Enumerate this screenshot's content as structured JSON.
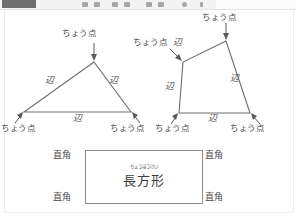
{
  "toolbar": {
    "present": true,
    "icon_names": [
      "menu-button",
      "tool-icon-1",
      "tool-icon-2",
      "tool-icon-3",
      "tool-icon-4",
      "tool-icon-5",
      "tool-icon-6",
      "tool-icon-7"
    ]
  },
  "worksheet": {
    "title": "",
    "figures": [
      {
        "name": "triangle",
        "vertex_labels": [
          "ちょう点",
          "ちょう点",
          "ちょう点"
        ],
        "side_labels": [
          "辺",
          "辺",
          "辺"
        ]
      },
      {
        "name": "quadrilateral",
        "vertex_labels": [
          "ちょう点",
          "ちょう点",
          "ちょう点",
          "ちょう点"
        ],
        "side_labels": [
          "辺",
          "辺",
          "辺",
          "辺"
        ]
      },
      {
        "name": "rectangle",
        "corner_labels": [
          "直角",
          "直角",
          "直角",
          "直角"
        ],
        "furigana": "ちょうほうけい",
        "kanji": "長方形"
      }
    ]
  },
  "colors": {
    "ink": "#6a6a6a",
    "text": "#4a4a4a",
    "rect_border": "#8d8d8d",
    "toolbar_bg": "#f4f4f4",
    "toolbar_button": "#6f6f6f",
    "page_bg": "#ffffff"
  }
}
